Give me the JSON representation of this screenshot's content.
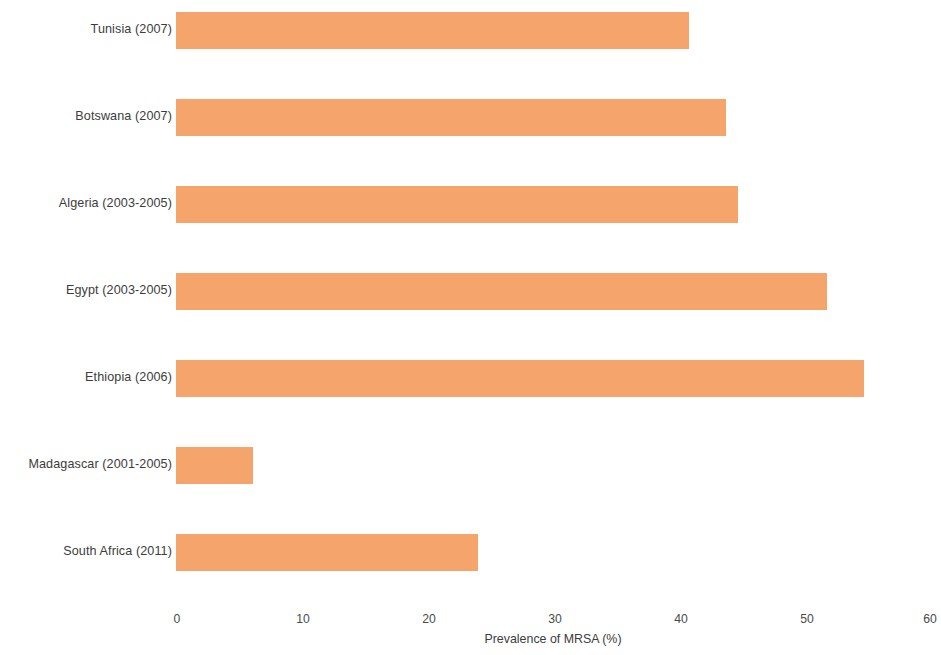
{
  "chart_data": {
    "type": "bar",
    "orientation": "horizontal",
    "title": "",
    "xlabel": "Prevalence of MRSA (%)",
    "ylabel": "",
    "xlim": [
      0,
      60
    ],
    "xticks": [
      0,
      10,
      20,
      30,
      40,
      50,
      60
    ],
    "xtick_labels": [
      "0",
      "10",
      "20",
      "30",
      "40",
      "50",
      "60"
    ],
    "grid": false,
    "legend": false,
    "bar_color": "#f5a46b",
    "categories": [
      "Tunisia (2007)",
      "Botswana (2007)",
      "Algeria (2003-2005)",
      "Egypt (2003-2005)",
      "Ethiopia (2006)",
      "Madagascar (2001-2005)",
      "South Africa (2011)"
    ],
    "values": [
      40.9,
      43.8,
      44.8,
      51.9,
      54.8,
      6.1,
      24.1
    ]
  }
}
